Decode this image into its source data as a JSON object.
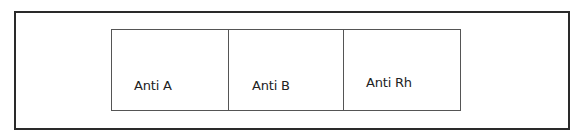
{
  "diagram": {
    "cells": [
      {
        "label": "Anti A"
      },
      {
        "label": "Anti B"
      },
      {
        "label": "Anti Rh"
      }
    ]
  }
}
